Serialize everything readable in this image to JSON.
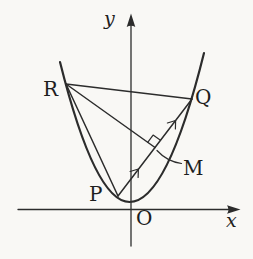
{
  "figure": {
    "type": "parabola-geometry-diagram",
    "colors": {
      "background": "#f9f8f5",
      "stroke": "#2c2c2c",
      "text": "#1e1e1e"
    },
    "axes": {
      "x_label": "x",
      "y_label": "y",
      "origin_label": "O"
    },
    "point_labels": {
      "R": "R",
      "Q": "Q",
      "P": "P",
      "M": "M"
    },
    "marks": {
      "right_angle_at": "M",
      "equal_segment_ticks": [
        "PM",
        "MQ"
      ]
    }
  }
}
